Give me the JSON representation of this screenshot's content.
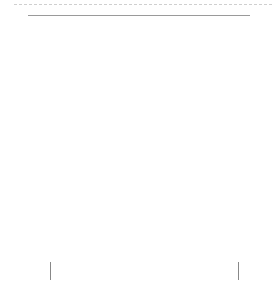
{
  "chart": {
    "title": "",
    "repeat_label": "Pattern Repeat = 16 stitches",
    "rows": 26,
    "columns": 21,
    "left_row_labels": [
      "26",
      "24",
      "22",
      "20",
      "18",
      "16",
      "14",
      "12",
      "10",
      "8",
      "6",
      "4",
      "2"
    ],
    "right_row_labels": [
      "25",
      "23",
      "21",
      "19",
      "17",
      "15",
      "13",
      "11",
      "9",
      "7",
      "5",
      "3",
      "1"
    ],
    "legend_symbols": {
      "dot": "purl / edge stitch (filled circle)",
      "circ": "circle with bar",
      "archA": "outlined arch with dot",
      "archB": "gray arch with filled square",
      "sq": "filled square",
      "arc": "filled arc (gathered stitch)"
    },
    "colors": {
      "grid_line": "#9a9a9a",
      "shade": "#d4d4d4",
      "ink": "#222222"
    }
  },
  "chart_data": {
    "type": "table",
    "xlabel": "Pattern Repeat = 16 stitches",
    "ylabel": "Row number",
    "row_labels_left": [
      26,
      24,
      22,
      20,
      18,
      16,
      14,
      12,
      10,
      8,
      6,
      4,
      2
    ],
    "row_labels_right": [
      25,
      23,
      21,
      19,
      17,
      15,
      13,
      11,
      9,
      7,
      5,
      3,
      1
    ],
    "special_rows": {
      "25": "filled arcs over columns 12-19",
      "13": "filled arcs over columns 3-10",
      "1": "alternating filled squares and circles"
    }
  }
}
